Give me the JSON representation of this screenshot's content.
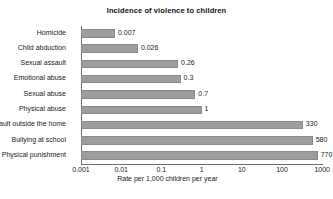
{
  "chart_data": {
    "type": "bar",
    "orientation": "horizontal",
    "title": "Incidence of violence to children",
    "xlabel": "Rate per 1,000 children per year",
    "ylabel": "",
    "xscale": "log",
    "xlim": [
      0.001,
      1000
    ],
    "xticks": [
      "0.001",
      "0.01",
      "0.1",
      "1",
      "10",
      "100",
      "1000"
    ],
    "xtick_values": [
      0.001,
      0.01,
      0.1,
      1,
      10,
      100,
      1000
    ],
    "grid": false,
    "legend": false,
    "bar_color": "#9d9d9d",
    "categories": [
      "Homicide",
      "Child abduction",
      "Sexual assault",
      "Emotional abuse",
      "Sexual abuse",
      "Physical abuse",
      "Assault outside the home",
      "Bullying at school",
      "Physical punishment"
    ],
    "values": [
      0.007,
      0.026,
      0.26,
      0.3,
      0.7,
      1,
      330,
      580,
      770
    ],
    "value_labels": [
      "0.007",
      "0.026",
      "0.26",
      "0.3",
      "0.7",
      "1",
      "330",
      "580",
      "770"
    ]
  }
}
